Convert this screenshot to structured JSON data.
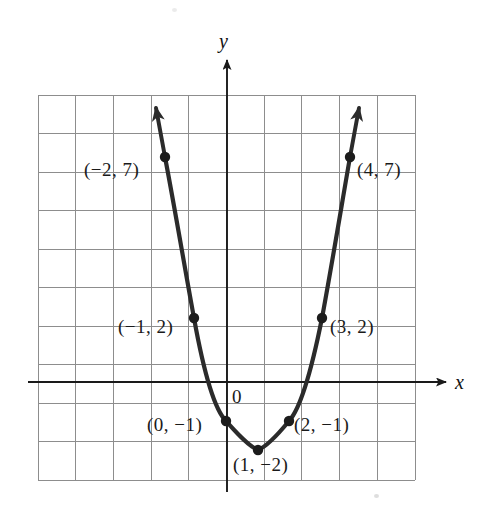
{
  "figure": {
    "kind": "coordinate-graph",
    "background_color": "#ffffff",
    "grid_color": "#8d8d8d",
    "axis_color": "#1a1a1a",
    "curve_color": "#2b2b2b",
    "point_color": "#1c1c1c",
    "label_color": "#1a1a1a"
  },
  "axes": {
    "x_label": "x",
    "y_label": "y",
    "origin_label": "0"
  },
  "point_labels": [
    {
      "text": "(−2, 7)",
      "left": 84,
      "top": 160
    },
    {
      "text": "(4, 7)",
      "left": 357,
      "top": 160
    },
    {
      "text": "(−1, 2)",
      "left": 118,
      "top": 317
    },
    {
      "text": "(3, 2)",
      "left": 330,
      "top": 317
    },
    {
      "text": "(0, −1)",
      "left": 147,
      "top": 415
    },
    {
      "text": "(2, −1)",
      "left": 294,
      "top": 415
    },
    {
      "text": "(1, −2)",
      "left": 233,
      "top": 455
    }
  ],
  "chart_data": {
    "type": "line",
    "title": "",
    "xlabel": "x",
    "ylabel": "y",
    "grid": true,
    "legend": "none",
    "function": "y = x^2 - 2x - 1",
    "x": [
      -2,
      -1,
      0,
      1,
      2,
      3,
      4
    ],
    "values": [
      7,
      2,
      -1,
      -2,
      -1,
      2,
      7
    ],
    "points": [
      {
        "x": -2,
        "y": 7,
        "label": "(−2, 7)"
      },
      {
        "x": -1,
        "y": 2,
        "label": "(−1, 2)"
      },
      {
        "x": 0,
        "y": -1,
        "label": "(0, −1)"
      },
      {
        "x": 1,
        "y": -2,
        "label": "(1, −2)"
      },
      {
        "x": 2,
        "y": -1,
        "label": "(2, −1)"
      },
      {
        "x": 3,
        "y": 2,
        "label": "(3, 2)"
      },
      {
        "x": 4,
        "y": 7,
        "label": "(4, 7)"
      }
    ],
    "vertex": {
      "x": 1,
      "y": -2
    },
    "xlim": [
      -5,
      5
    ],
    "ylim": [
      -3,
      7
    ],
    "grid_step": 1,
    "arrows": [
      "curve-left-up",
      "curve-right-up",
      "x-axis-right",
      "y-axis-up"
    ]
  }
}
